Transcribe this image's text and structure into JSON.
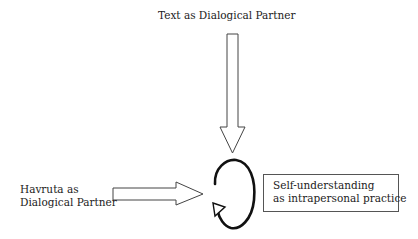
{
  "diagram": {
    "nodes": {
      "text_partner": {
        "label": "Text as Dialogical Partner"
      },
      "havruta_partner": {
        "lines": [
          "Havruta as",
          "Dialogical Partner"
        ]
      },
      "self_understanding": {
        "lines": [
          "Self-understanding",
          "as intrapersonal practice"
        ]
      }
    },
    "edges": [
      {
        "from": "Text as Dialogical Partner",
        "to": "cycle",
        "style": "hollow-arrow-down"
      },
      {
        "from": "Havruta as Dialogical Partner",
        "to": "cycle",
        "style": "hollow-arrow-right"
      }
    ],
    "cycle": {
      "type": "circular-arrow",
      "direction": "counterclockwise-open"
    },
    "colors": {
      "stroke": "#222222",
      "fill": "#ffffff",
      "box_border": "#555555"
    }
  }
}
